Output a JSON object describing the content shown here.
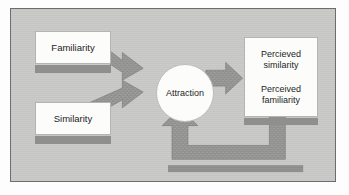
{
  "figure": {
    "background_color": "#c9c9c7",
    "border_color": "#6d6d6d",
    "arrow_color": "#8f8f8d",
    "box_fill_color": "#fcfcfb",
    "text_color": "#1d1d1d"
  },
  "nodes": {
    "familiarity": {
      "label": "Familiarity"
    },
    "similarity": {
      "label": "Similarity"
    },
    "attraction": {
      "label": "Attraction"
    },
    "outcomes": {
      "line1": "Percieved",
      "line2": "similarity",
      "line3": "Perceived",
      "line4": "familiarity"
    }
  },
  "arrows": [
    {
      "name": "familiarity-to-attraction",
      "from": "Familiarity",
      "to": "Attraction",
      "direction": "down-right"
    },
    {
      "name": "similarity-to-attraction",
      "from": "Similarity",
      "to": "Attraction",
      "direction": "up-right"
    },
    {
      "name": "attraction-to-outcomes",
      "from": "Attraction",
      "to": "Perceived outcomes",
      "direction": "right"
    },
    {
      "name": "outcomes-feedback-to-attraction",
      "from": "Perceived outcomes",
      "to": "Attraction",
      "direction": "feedback-loop-up"
    }
  ]
}
